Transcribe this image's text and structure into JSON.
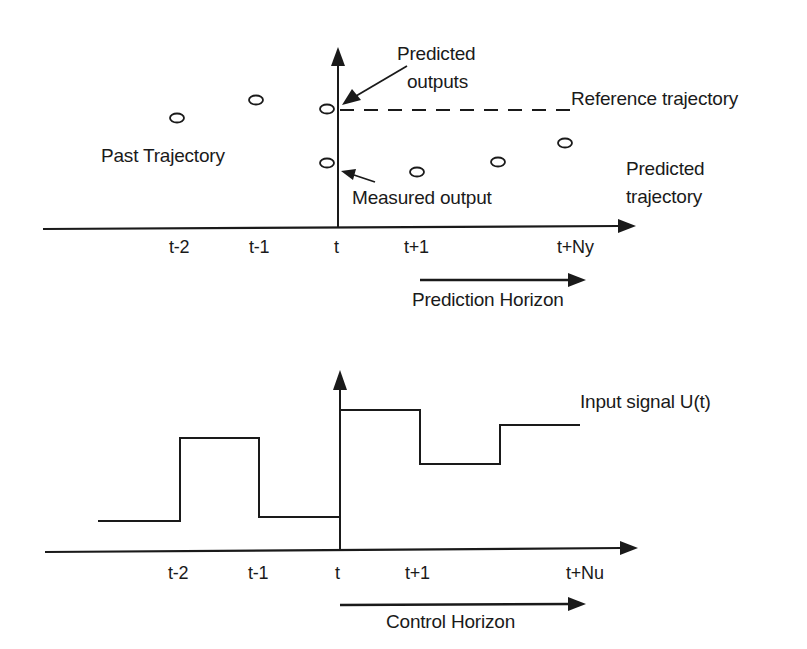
{
  "top_diagram": {
    "labels": {
      "predicted_outputs_line1": "Predicted",
      "predicted_outputs_line2": "outputs",
      "reference_trajectory": "Reference trajectory",
      "past_trajectory": "Past Trajectory",
      "measured_output": "Measured output",
      "predicted_trajectory_line1": "Predicted",
      "predicted_trajectory_line2": "trajectory",
      "prediction_horizon": "Prediction Horizon"
    },
    "ticks": [
      "t-2",
      "t-1",
      "t",
      "t+1",
      "t+Ny"
    ]
  },
  "bottom_diagram": {
    "labels": {
      "input_signal": "Input signal U(t)",
      "control_horizon": "Control Horizon"
    },
    "ticks": [
      "t-2",
      "t-1",
      "t",
      "t+1",
      "t+Nu"
    ]
  },
  "colors": {
    "ink": "#1a1a1a",
    "background": "#ffffff"
  }
}
